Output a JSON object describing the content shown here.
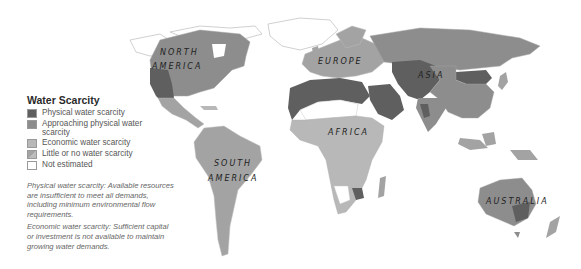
{
  "legend": {
    "title": "Water Scarcity",
    "items": [
      {
        "label": "Physical water scarcity",
        "color": "#5f5f5f"
      },
      {
        "label": "Approaching physical water scarcity",
        "color": "#8d8d8d"
      },
      {
        "label": "Economic water scarcity",
        "color": "#b8b8b8"
      },
      {
        "label": "Little or no water scarcity",
        "color": "#a3a3a3"
      },
      {
        "label": "Not estimated",
        "color": "#ffffff"
      }
    ]
  },
  "notes": {
    "physical": "Physical water scarcity: Available resources are insufficient to meet all demands, including minimum environmental flow requirements.",
    "economic": "Economic water scarcity: Sufficient capital or investment is not available to maintain growing water demands."
  },
  "regions": {
    "north_america_1": "NORTH",
    "north_america_2": "AMERICA",
    "south_america_1": "SOUTH",
    "south_america_2": "AMERICA",
    "europe": "EUROPE",
    "asia": "ASIA",
    "africa": "AFRICA",
    "australia": "AUSTRALIA"
  }
}
